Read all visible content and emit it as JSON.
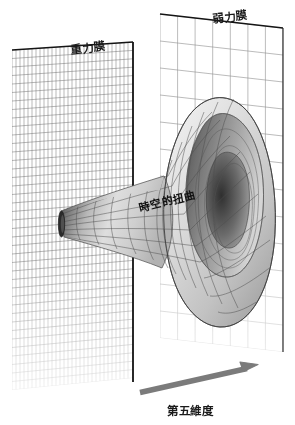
{
  "figure": {
    "title_internal": "Warped extra dimension brane diagram",
    "background_color": "#ffffff",
    "width": 295,
    "height": 425
  },
  "labels": {
    "gravity_brane": "重力膜",
    "weak_brane": "弱力膜",
    "spacetime_warp": "時空的扭曲",
    "fifth_dimension": "第五維度"
  },
  "colors": {
    "ink": "#1a1a1a",
    "grid_fine": "#6f6f6f",
    "grid_coarse": "#8a8a8a",
    "plane_edge": "#111111",
    "arrow": "#787878",
    "funnel_dark": "#3a3a3a",
    "funnel_light": "#e8e8e8",
    "funnel_line": "#4a4a4a"
  },
  "elements": {
    "gravity_plane": {
      "name": "重力膜",
      "grid": "fine",
      "position": "left",
      "columns": 30,
      "rows": 40
    },
    "weak_plane": {
      "name": "弱力膜",
      "grid": "coarse",
      "position": "right",
      "columns": 7,
      "rows": 12
    },
    "funnel": {
      "name": "時空的扭曲",
      "throat_side": "left",
      "bell_side": "right",
      "meridians": 16,
      "latitudes": 13
    },
    "axis_arrow": {
      "name": "第五維度",
      "direction": "right",
      "from": [
        140,
        392
      ],
      "to": [
        258,
        365
      ]
    }
  }
}
